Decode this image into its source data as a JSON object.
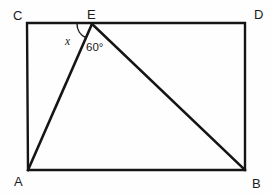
{
  "figure": {
    "kind": "geometry-diagram",
    "background_color": "#fefefe",
    "line_color": "#151515",
    "text_color": "#1a1a1a"
  },
  "vertices": {
    "C": {
      "label": "C",
      "label_x": 13,
      "label_y": 20,
      "point_x": 27,
      "point_y": 23
    },
    "E": {
      "label": "E",
      "label_x": 87,
      "label_y": 19,
      "point_x": 92,
      "point_y": 24
    },
    "D": {
      "label": "D",
      "label_x": 254,
      "label_y": 19,
      "point_x": 245,
      "point_y": 23
    },
    "A": {
      "label": "A",
      "label_x": 14,
      "label_y": 186,
      "point_x": 28,
      "point_y": 170
    },
    "B": {
      "label": "B",
      "label_x": 252,
      "label_y": 188,
      "point_x": 245,
      "point_y": 170
    }
  },
  "angles": {
    "x": {
      "label": "x",
      "label_x": 65,
      "label_y": 45,
      "arc_radius": 15,
      "note": "angle between side CE and segment EA at vertex E"
    },
    "sixty": {
      "label": "60°",
      "value": 60,
      "unit": "degrees",
      "label_x": 86,
      "label_y": 51,
      "note": "angle between segment EA and segment EB at vertex E"
    }
  },
  "shapes": {
    "rectangle": {
      "name": "rectangle-CDBA",
      "left": 27,
      "top": 23,
      "right": 245,
      "bottom": 170,
      "stroke_width": 2.4
    },
    "segment_EA": {
      "name": "segment-E-A",
      "x1": 92,
      "y1": 24,
      "x2": 28,
      "y2": 170,
      "stroke_width": 2.6
    },
    "segment_EB": {
      "name": "segment-E-B",
      "x1": 92,
      "y1": 24,
      "x2": 245,
      "y2": 170,
      "stroke_width": 2.6
    }
  }
}
